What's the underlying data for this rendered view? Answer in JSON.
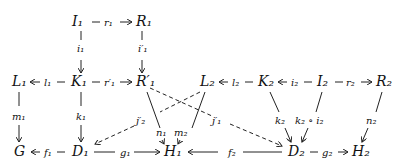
{
  "diagram": {
    "type": "commutative-diagram",
    "nodes": {
      "I1": "I₁",
      "R1": "R₁",
      "L1": "L₁",
      "K1": "K₁",
      "R1p": "R′₁",
      "L2": "L₂",
      "K2": "K₂",
      "I2": "I₂",
      "R2": "R₂",
      "G": "G",
      "D1": "D₁",
      "H1": "H₁",
      "D2": "D₂",
      "H2": "H₂"
    },
    "edges": {
      "r1": "r₁",
      "i1": "i₁",
      "i1p": "i′₁",
      "l1": "l₁",
      "r1p": "r′₁",
      "l2": "l₂",
      "i2": "i₂",
      "r2": "r₂",
      "m1": "m₁",
      "k1": "k₁",
      "j2p": "j′₂",
      "n1": "n₁",
      "m2": "m₂",
      "j1p": "j′₁",
      "k2": "k₂",
      "k2i2": "k₂ ∘ i₂",
      "n2": "n₂",
      "f1": "f₁",
      "g1": "g₁",
      "f2": "f₂",
      "g2": "g₂"
    }
  }
}
